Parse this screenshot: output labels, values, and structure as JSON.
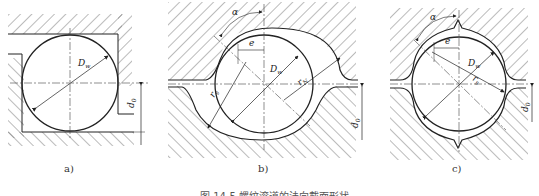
{
  "figure": {
    "caption": "图 14-5  螺纹滚道的法向截面形状",
    "panels": [
      {
        "id": "a",
        "label": "a)",
        "profile": "rectangular",
        "dims": {
          "ball": "D",
          "ball_sub": "w",
          "offset": "d",
          "offset_sub": "0"
        }
      },
      {
        "id": "b",
        "label": "b)",
        "profile": "gothic-arch",
        "dims": {
          "angle": "α",
          "eccentricity": "e",
          "ball": "D",
          "ball_sub": "w",
          "radius": "r",
          "radius_sub": "s",
          "radius2": "r",
          "radius2_sub": "N",
          "offset": "d",
          "offset_sub": "0"
        }
      },
      {
        "id": "c",
        "label": "c)",
        "profile": "double-arc",
        "dims": {
          "angle": "α",
          "eccentricity": "e",
          "ball": "D",
          "ball_sub": "w",
          "radius": "r",
          "radius_sub": "s",
          "offset": "d",
          "offset_sub": "0"
        }
      }
    ]
  },
  "colors": {
    "line": "#222222",
    "hatch": "#555555",
    "background": "#ffffff"
  }
}
